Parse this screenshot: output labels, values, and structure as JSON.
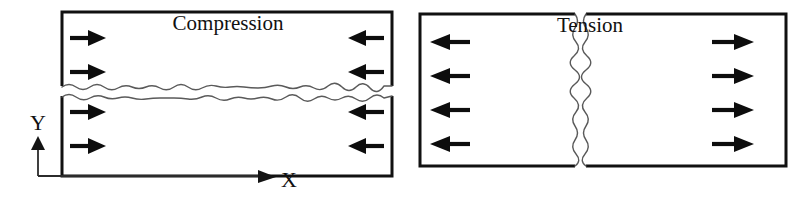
{
  "figure": {
    "name": "compression-vs-tension-fracture-diagram",
    "background_color": "#ffffff",
    "width": 800,
    "height": 203
  },
  "axes": {
    "x_label": "X",
    "y_label": "Y",
    "origin": {
      "x": 38,
      "y": 176
    },
    "x_axis_end": {
      "x": 276,
      "y": 176
    },
    "y_axis_end": {
      "x": 38,
      "y": 138
    },
    "x_label_pos": {
      "x": 288,
      "y": 184
    },
    "y_label_pos": {
      "x": 38,
      "y": 130
    },
    "color": "#2b2b2b"
  },
  "panels": [
    {
      "id": "compression",
      "title": "Compression",
      "title_pos": {
        "x": 228,
        "y": 30
      },
      "box": {
        "x": 62,
        "y": 12,
        "width": 330,
        "height": 164
      },
      "border_color": "#111111",
      "border_width": 3,
      "crack": {
        "orientation": "horizontal",
        "description": "wavy horizontal split across full specimen width",
        "mean_y": 91,
        "gap": 10,
        "color": "#5a5a5a"
      },
      "arrows": [
        {
          "side": "left",
          "direction": "right",
          "x": 70,
          "y": 38
        },
        {
          "side": "left",
          "direction": "right",
          "x": 70,
          "y": 72
        },
        {
          "side": "left",
          "direction": "right",
          "x": 70,
          "y": 112
        },
        {
          "side": "left",
          "direction": "right",
          "x": 70,
          "y": 146
        },
        {
          "side": "right",
          "direction": "left",
          "x": 384,
          "y": 38
        },
        {
          "side": "right",
          "direction": "left",
          "x": 384,
          "y": 72
        },
        {
          "side": "right",
          "direction": "left",
          "x": 384,
          "y": 112
        },
        {
          "side": "right",
          "direction": "left",
          "x": 384,
          "y": 146
        }
      ]
    },
    {
      "id": "tension",
      "title": "Tension",
      "title_pos": {
        "x": 590,
        "y": 32
      },
      "box": {
        "x": 420,
        "y": 14,
        "width": 366,
        "height": 152
      },
      "border_color": "#111111",
      "border_width": 3,
      "crack": {
        "orientation": "vertical",
        "description": "wavy vertical split through full specimen height",
        "mean_x": 580,
        "gap": 11,
        "color": "#5a5a5a"
      },
      "arrows": [
        {
          "side": "left",
          "direction": "left",
          "x": 428,
          "y": 42
        },
        {
          "side": "left",
          "direction": "left",
          "x": 428,
          "y": 76
        },
        {
          "side": "left",
          "direction": "left",
          "x": 428,
          "y": 110
        },
        {
          "side": "left",
          "direction": "left",
          "x": 428,
          "y": 144
        },
        {
          "side": "right",
          "direction": "right",
          "x": 720,
          "y": 42
        },
        {
          "side": "right",
          "direction": "right",
          "x": 720,
          "y": 76
        },
        {
          "side": "right",
          "direction": "right",
          "x": 720,
          "y": 110
        },
        {
          "side": "right",
          "direction": "right",
          "x": 720,
          "y": 144
        }
      ]
    }
  ],
  "style": {
    "arrow_color": "#0d0d0d",
    "crack_color": "#5a5a5a",
    "text_color": "#111111"
  }
}
